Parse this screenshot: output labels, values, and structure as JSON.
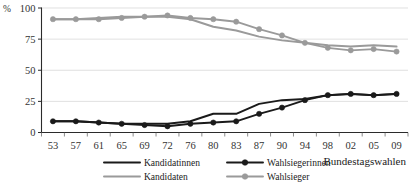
{
  "chart_data": {
    "type": "line",
    "title": "",
    "xlabel": "Bundestagswahlen",
    "ylabel": "%",
    "ylim": [
      0,
      100
    ],
    "yticks": [
      0,
      25,
      50,
      75,
      100
    ],
    "grid": true,
    "legend_position": "bottom",
    "categories": [
      "53",
      "57",
      "61",
      "65",
      "69",
      "72",
      "76",
      "80",
      "83",
      "87",
      "90",
      "94",
      "98",
      "02",
      "05",
      "09"
    ],
    "series": [
      {
        "name": "Kandidatinnen",
        "color": "#1a1a1a",
        "marker": "none",
        "values": [
          9,
          9,
          8,
          7,
          7,
          7,
          9,
          15,
          15,
          23,
          26,
          27,
          30,
          31,
          30,
          31
        ]
      },
      {
        "name": "Kandidaten",
        "color": "#9a9a9a",
        "marker": "none",
        "values": [
          91,
          91,
          92,
          93,
          93,
          93,
          91,
          85,
          82,
          77,
          74,
          72,
          70,
          69,
          70,
          69
        ]
      },
      {
        "name": "Wahlsiegerinnen",
        "color": "#1a1a1a",
        "marker": "circle",
        "values": [
          9,
          9,
          8,
          7,
          6,
          5,
          7,
          8,
          9,
          15,
          20,
          26,
          30,
          31,
          30,
          31
        ]
      },
      {
        "name": "Wahlsieger",
        "color": "#9a9a9a",
        "marker": "circle",
        "values": [
          91,
          91,
          91,
          92,
          93,
          94,
          92,
          91,
          89,
          83,
          78,
          72,
          68,
          66,
          67,
          65
        ]
      }
    ]
  },
  "axis": {
    "y_unit": "%",
    "y_tick_labels": [
      "100",
      "75",
      "50",
      "25",
      "0"
    ],
    "x_tick_labels": [
      "53",
      "57",
      "61",
      "65",
      "69",
      "72",
      "76",
      "80",
      "83",
      "87",
      "90",
      "94",
      "98",
      "02",
      "05",
      "09"
    ],
    "x_title": "Bundestagswahlen"
  },
  "legend": {
    "entries": [
      {
        "label": "Kandidatinnen",
        "color": "#1a1a1a",
        "marker": false
      },
      {
        "label": "Wahlsiegerinnen",
        "color": "#1a1a1a",
        "marker": true
      },
      {
        "label": "Kandidaten",
        "color": "#9a9a9a",
        "marker": false
      },
      {
        "label": "Wahlsieger",
        "color": "#9a9a9a",
        "marker": true
      }
    ]
  }
}
